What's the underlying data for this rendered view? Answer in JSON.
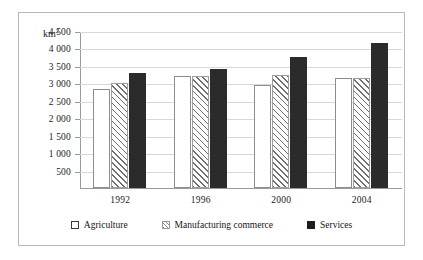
{
  "chart_data": {
    "type": "bar",
    "title": "",
    "xlabel": "",
    "ylabel": "km²",
    "unit_label": "km²",
    "categories": [
      "1992",
      "1996",
      "2000",
      "2004"
    ],
    "series": [
      {
        "name": "Agriculture",
        "values": [
          2850,
          3200,
          2950,
          3150
        ],
        "style": "white-outline",
        "color": "#ffffff"
      },
      {
        "name": "Manufacturing commerce",
        "values": [
          3000,
          3200,
          3250,
          3150
        ],
        "style": "diagonal-hatch",
        "color": "#707070"
      },
      {
        "name": "Services",
        "values": [
          3300,
          3400,
          3750,
          4150
        ],
        "style": "solid-black",
        "color": "#2b2b2b"
      }
    ],
    "ylim": [
      0,
      4500
    ],
    "ytick_values": [
      4500,
      4000,
      3500,
      3000,
      2500,
      2000,
      1500,
      1000,
      500
    ],
    "ytick_labels": [
      "4 500",
      "4 000",
      "3 500",
      "3 000",
      "2 500",
      "2 000",
      "1 500",
      "1 000",
      "500"
    ],
    "grid": true,
    "legend_position": "bottom"
  },
  "legend": {
    "items": [
      {
        "label": "Agriculture"
      },
      {
        "label": "Manufacturing commerce"
      },
      {
        "label": "Services"
      }
    ]
  }
}
